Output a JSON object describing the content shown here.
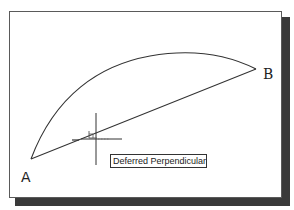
{
  "drawing": {
    "points": [
      {
        "label": "A",
        "x": 31,
        "y": 159
      },
      {
        "label": "B",
        "x": 256,
        "y": 69
      }
    ],
    "label_A": "A",
    "label_B": "B",
    "arc": {
      "from": "A",
      "to": "B",
      "apex": {
        "x": 180,
        "y": 53
      }
    },
    "line": {
      "from": "A",
      "to": "B"
    },
    "cursor": {
      "x": 96,
      "y": 139
    },
    "snap_marker": "perpendicular"
  },
  "tooltip": {
    "text": "Deferred Perpendicular"
  },
  "colors": {
    "line": "#333333",
    "frame_border": "#5a5a5a",
    "shadow": "#3a3a3a",
    "background": "#ffffff"
  }
}
